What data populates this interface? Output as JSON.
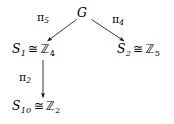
{
  "diagram": {
    "type": "commutative-diagram",
    "background_color": "#ffffff",
    "ink_color": "#000000",
    "nodes": [
      {
        "id": "G",
        "text": "G",
        "symbol": "G",
        "position": {
          "x": 84,
          "y": 14
        }
      },
      {
        "id": "S1",
        "text": "S_1 ≅ ℨ4",
        "group": "S",
        "group_subscript": "1",
        "relation": "≅",
        "iso_to": "ℤ",
        "iso_subscript": "4",
        "position": {
          "x": 46,
          "y": 49
        }
      },
      {
        "id": "S2",
        "text": "S_2 ≅ ℨ5",
        "group": "S",
        "group_subscript": "2",
        "relation": "≅",
        "iso_to": "ℤ",
        "iso_subscript": "5",
        "position": {
          "x": 141,
          "y": 49
        }
      },
      {
        "id": "S10",
        "text": "S_10 ≅ ℨ2",
        "group": "S",
        "group_subscript": "10",
        "relation": "≅",
        "iso_to": "ℤ",
        "iso_subscript": "2",
        "position": {
          "x": 46,
          "y": 107
        }
      }
    ],
    "edges": [
      {
        "id": "G-to-S1",
        "from": "G",
        "to": "S1",
        "label": "π",
        "label_subscript": "5",
        "direction": "down-left",
        "arrowhead": "end"
      },
      {
        "id": "G-to-S2",
        "from": "G",
        "to": "S2",
        "label": "π",
        "label_subscript": "4",
        "direction": "down-right",
        "arrowhead": "end"
      },
      {
        "id": "S1-to-S10",
        "from": "S1",
        "to": "S10",
        "label": "π",
        "label_subscript": "2",
        "direction": "down",
        "arrowhead": "end"
      }
    ]
  }
}
